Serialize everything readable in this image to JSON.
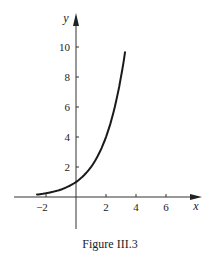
{
  "figure": {
    "caption": "Figure III.3"
  },
  "chart_data": {
    "type": "line",
    "title": "",
    "caption": "Figure III.3",
    "xlabel": "x",
    "ylabel": "y",
    "function": "y = 2^x",
    "xlim": [
      -3.5,
      4.2
    ],
    "ylim": [
      -2.2,
      12
    ],
    "x_ticks": [
      -2,
      2,
      4,
      6
    ],
    "x_tick_labels": [
      "−2",
      "2",
      "4",
      "6"
    ],
    "y_ticks": [
      2,
      4,
      6,
      8,
      10
    ],
    "y_tick_labels": [
      "2",
      "4",
      "6",
      "8",
      "10"
    ],
    "grid": false,
    "legend": null,
    "series": [
      {
        "name": "curve",
        "x": [
          -2.6,
          -2,
          -1,
          0,
          1,
          2,
          2.5,
          3,
          3.27
        ],
        "values": [
          0.16,
          0.25,
          0.5,
          1,
          2,
          4,
          5.66,
          8,
          9.65
        ]
      }
    ]
  },
  "axes": {
    "x_label": "x",
    "y_label": "y",
    "x_tick_labels": [
      "−2",
      "2",
      "4",
      "6"
    ],
    "y_tick_labels": [
      "2",
      "4",
      "6",
      "8",
      "10"
    ]
  }
}
